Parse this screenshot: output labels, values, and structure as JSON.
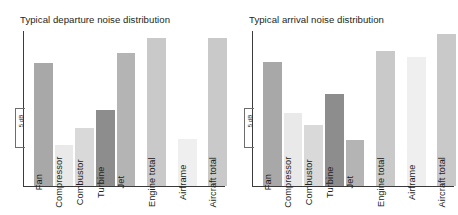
{
  "figure": {
    "background": "#ffffff",
    "axis_color": "#3b3b3b"
  },
  "chart_data": [
    {
      "type": "bar",
      "title": "Typical departure noise distribution",
      "xlabel": "",
      "ylabel": "",
      "scale_bracket": "5 dB",
      "grid": false,
      "legend": "none",
      "y_unit": "dB",
      "y_axis_note": "relative scale, 5 dB bracket shown, no numeric ticks",
      "categories": [
        "Fan",
        "Compressor",
        "Combustor",
        "Turbine",
        "Jet",
        "Engine total",
        "Airframe",
        "Aircraft total"
      ],
      "values": [
        79.4,
        26.5,
        37.4,
        49.0,
        85.8,
        95.5,
        30.3,
        95.5
      ],
      "bar_colors": [
        "#a8a8a8",
        "#e9e9e9",
        "#d9d9d9",
        "#8d8d8d",
        "#b4b4b4",
        "#c9c9c9",
        "#efefef",
        "#c9c9c9"
      ],
      "bars": [
        {
          "label": "Fan",
          "value": 79.4,
          "color": "#a8a8a8",
          "x": 11,
          "w": 19,
          "top": 32
        },
        {
          "label": "Compressor",
          "value": 26.5,
          "color": "#e9e9e9",
          "x": 32,
          "w": 18,
          "top": 114
        },
        {
          "label": "Combustor",
          "value": 37.4,
          "color": "#d9d9d9",
          "x": 52,
          "w": 19,
          "top": 97
        },
        {
          "label": "Turbine",
          "value": 49.0,
          "color": "#8d8d8d",
          "x": 73,
          "w": 19,
          "top": 79
        },
        {
          "label": "Jet",
          "value": 85.8,
          "color": "#b4b4b4",
          "x": 94,
          "w": 18,
          "top": 22
        },
        {
          "label": "Engine total",
          "value": 95.5,
          "color": "#c9c9c9",
          "x": 124,
          "w": 19,
          "top": 7
        },
        {
          "label": "Airframe",
          "value": 30.3,
          "color": "#efefef",
          "x": 155,
          "w": 19,
          "top": 108
        },
        {
          "label": "Aircraft total",
          "value": 95.5,
          "color": "#c9c9c9",
          "x": 185,
          "w": 19,
          "top": 7
        }
      ]
    },
    {
      "type": "bar",
      "title": "Typical arrival noise distribution",
      "xlabel": "",
      "ylabel": "",
      "scale_bracket": "5 dB",
      "grid": false,
      "legend": "none",
      "y_unit": "dB",
      "y_axis_note": "relative scale, 5 dB bracket shown, no numeric ticks",
      "categories": [
        "Fan",
        "Compressor",
        "Combustor",
        "Turbine",
        "Jet",
        "Engine total",
        "Airframe",
        "Aircraft total"
      ],
      "values": [
        80.0,
        47.1,
        39.4,
        59.4,
        29.7,
        87.1,
        83.2,
        98.1
      ],
      "bar_colors": [
        "#a8a8a8",
        "#e9e9e9",
        "#d9d9d9",
        "#8d8d8d",
        "#b4b4b4",
        "#c9c9c9",
        "#efefef",
        "#c9c9c9"
      ],
      "bars": [
        {
          "label": "Fan",
          "value": 80.0,
          "color": "#a8a8a8",
          "x": 11,
          "w": 19,
          "top": 31
        },
        {
          "label": "Compressor",
          "value": 47.1,
          "color": "#e9e9e9",
          "x": 32,
          "w": 18,
          "top": 82
        },
        {
          "label": "Combustor",
          "value": 39.4,
          "color": "#d9d9d9",
          "x": 52,
          "w": 19,
          "top": 94
        },
        {
          "label": "Turbine",
          "value": 59.4,
          "color": "#8d8d8d",
          "x": 73,
          "w": 19,
          "top": 63
        },
        {
          "label": "Jet",
          "value": 29.7,
          "color": "#b4b4b4",
          "x": 94,
          "w": 18,
          "top": 109
        },
        {
          "label": "Engine total",
          "value": 87.1,
          "color": "#c9c9c9",
          "x": 124,
          "w": 19,
          "top": 20
        },
        {
          "label": "Airframe",
          "value": 83.2,
          "color": "#efefef",
          "x": 155,
          "w": 19,
          "top": 26
        },
        {
          "label": "Aircraft total",
          "value": 98.1,
          "color": "#c9c9c9",
          "x": 185,
          "w": 19,
          "top": 3
        }
      ]
    }
  ]
}
